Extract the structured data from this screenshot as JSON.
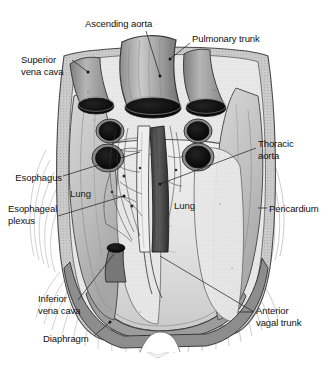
{
  "figure": {
    "width": 331,
    "height": 371,
    "background_color": "#ffffff",
    "ink_color": "#111111",
    "style": "grayscale halftone medical illustration"
  },
  "labels": [
    {
      "id": "ascending-aorta",
      "text": "Ascending aorta",
      "x": 85,
      "y": 18,
      "align": "left"
    },
    {
      "id": "pulmonary-trunk",
      "text": "Pulmonary trunk",
      "x": 192,
      "y": 33,
      "align": "left"
    },
    {
      "id": "superior-vena-cava",
      "text": "Superior\nvena cava",
      "x": 21,
      "y": 54,
      "align": "left"
    },
    {
      "id": "thoracic-aorta",
      "text": "Thoracic\naorta",
      "x": 258,
      "y": 138,
      "align": "left"
    },
    {
      "id": "esophagus",
      "text": "Esophagus",
      "x": 60,
      "y": 172,
      "align": "right"
    },
    {
      "id": "lung-left",
      "text": "Lung",
      "x": 70,
      "y": 188,
      "align": "left"
    },
    {
      "id": "esophageal-plexus",
      "text": "Esophageal\nplexus",
      "x": 8,
      "y": 203,
      "align": "left"
    },
    {
      "id": "lung-right",
      "text": "Lung",
      "x": 174,
      "y": 200,
      "align": "left"
    },
    {
      "id": "pericardium",
      "text": "Pericardium",
      "x": 269,
      "y": 203,
      "align": "left"
    },
    {
      "id": "inferior-vena-cava",
      "text": "Inferior\nvena cava",
      "x": 38,
      "y": 293,
      "align": "left"
    },
    {
      "id": "anterior-vagal-trunk",
      "text": "Anterior\nvagal trunk",
      "x": 256,
      "y": 305,
      "align": "left"
    },
    {
      "id": "diaphragm",
      "text": "Diaphragm",
      "x": 43,
      "y": 333,
      "align": "left"
    }
  ],
  "structures": [
    {
      "id": "ascending-aorta",
      "name": "Ascending aorta"
    },
    {
      "id": "pulmonary-trunk",
      "name": "Pulmonary trunk"
    },
    {
      "id": "superior-vena-cava",
      "name": "Superior vena cava"
    },
    {
      "id": "thoracic-aorta",
      "name": "Thoracic aorta"
    },
    {
      "id": "esophagus",
      "name": "Esophagus"
    },
    {
      "id": "esophageal-plexus",
      "name": "Esophageal plexus"
    },
    {
      "id": "lung-left",
      "name": "Lung"
    },
    {
      "id": "lung-right",
      "name": "Lung"
    },
    {
      "id": "pericardium",
      "name": "Pericardium"
    },
    {
      "id": "inferior-vena-cava",
      "name": "Inferior vena cava"
    },
    {
      "id": "anterior-vagal-trunk",
      "name": "Anterior vagal trunk"
    },
    {
      "id": "diaphragm",
      "name": "Diaphragm"
    }
  ]
}
